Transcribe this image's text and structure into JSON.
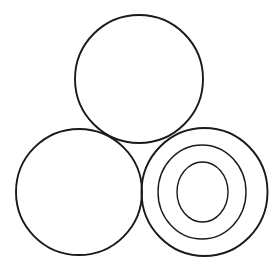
{
  "figure": {
    "caption": "",
    "canvas": {
      "width": 279,
      "height": 271,
      "background": "#ffffff"
    },
    "style": {
      "stroke_color": "#1a1a1a",
      "fill": "none",
      "stroke_width_outer": 1.9,
      "stroke_width_ring": 1.5
    },
    "shapes": [
      {
        "id": "top-circle",
        "name": "top-circle",
        "type": "ellipse",
        "cx": 139,
        "cy": 79,
        "rx": 64,
        "ry": 64,
        "stroke_width": 1.9
      },
      {
        "id": "bottom-left-circle",
        "name": "bottom-left-circle",
        "type": "ellipse",
        "cx": 79,
        "cy": 192,
        "rx": 63,
        "ry": 63,
        "stroke_width": 1.9
      },
      {
        "id": "bottom-right-outer-circle",
        "name": "bottom-right-outer-circle",
        "type": "ellipse",
        "cx": 204.5,
        "cy": 192,
        "rx": 63,
        "ry": 64,
        "stroke_width": 1.9
      },
      {
        "id": "bottom-right-middle-ring",
        "name": "bottom-right-middle-ring",
        "type": "ellipse",
        "cx": 202,
        "cy": 192,
        "rx": 44,
        "ry": 47,
        "stroke_width": 1.4
      },
      {
        "id": "bottom-right-inner-ring",
        "name": "bottom-right-inner-ring",
        "type": "ellipse",
        "cx": 202.5,
        "cy": 192,
        "rx": 25.5,
        "ry": 30,
        "stroke_width": 1.4
      }
    ]
  }
}
